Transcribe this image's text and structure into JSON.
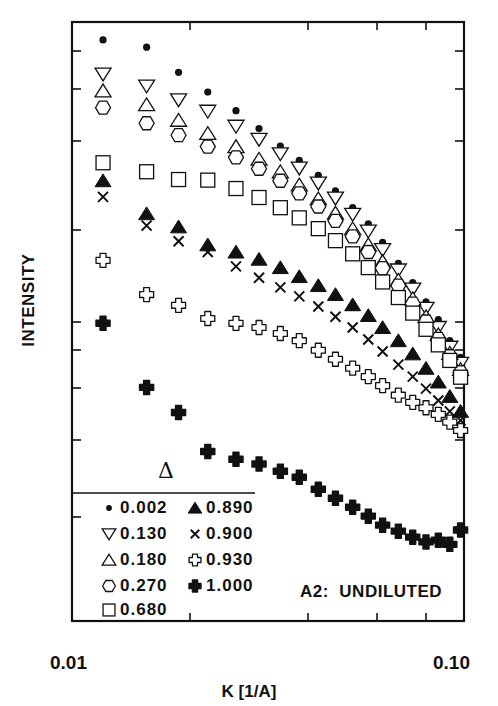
{
  "chart_data": {
    "type": "scatter",
    "title": "",
    "xlabel": "K [1/A]",
    "ylabel": "INTENSITY",
    "xscale": "log",
    "xlim": [
      0.01,
      0.1
    ],
    "x_tick_labels": [
      "0.01",
      "0.10"
    ],
    "x_minor_ticks": [
      0.02,
      0.04,
      0.06,
      0.08
    ],
    "yscale": "log (unlabeled, arbitrary units)",
    "y_note": "y values are relative positions (0 = bottom of frame, 1 = top of frame) read from the plot; axis has no numeric labels",
    "ylim": [
      0,
      1
    ],
    "grid": false,
    "annotation": "A2:  UNDILUTED",
    "legend": {
      "title": "Δ",
      "position": "lower-left",
      "entries": [
        {
          "marker": "filled-circle",
          "label": "0.002"
        },
        {
          "marker": "down-triangle",
          "label": "0.130"
        },
        {
          "marker": "up-triangle",
          "label": "0.180"
        },
        {
          "marker": "hexagon",
          "label": "0.270"
        },
        {
          "marker": "square",
          "label": "0.680"
        },
        {
          "marker": "filled-triangle",
          "label": "0.890"
        },
        {
          "marker": "cross",
          "label": "0.900"
        },
        {
          "marker": "open-cross",
          "label": "0.930"
        },
        {
          "marker": "filled-cross",
          "label": "1.000"
        }
      ]
    },
    "series": [
      {
        "name": "0.002",
        "marker": "filled-circle",
        "x": [
          0.012,
          0.0155,
          0.0187,
          0.0222,
          0.0262,
          0.03,
          0.034,
          0.038,
          0.0425,
          0.047,
          0.052,
          0.057,
          0.062,
          0.068,
          0.074,
          0.08,
          0.086,
          0.092,
          0.098
        ],
        "y": [
          0.97,
          0.958,
          0.916,
          0.883,
          0.852,
          0.822,
          0.793,
          0.769,
          0.744,
          0.718,
          0.69,
          0.663,
          0.632,
          0.597,
          0.565,
          0.533,
          0.503,
          0.468,
          0.44
        ]
      },
      {
        "name": "0.130",
        "marker": "down-triangle",
        "x": [
          0.012,
          0.0155,
          0.0187,
          0.0222,
          0.0262,
          0.03,
          0.034,
          0.038,
          0.0425,
          0.047,
          0.052,
          0.057,
          0.062,
          0.068,
          0.074,
          0.08,
          0.086,
          0.092,
          0.098
        ],
        "y": [
          0.913,
          0.893,
          0.87,
          0.851,
          0.826,
          0.804,
          0.78,
          0.756,
          0.731,
          0.706,
          0.679,
          0.651,
          0.62,
          0.586,
          0.554,
          0.522,
          0.49,
          0.457,
          0.43
        ]
      },
      {
        "name": "0.180",
        "marker": "up-triangle",
        "x": [
          0.012,
          0.0155,
          0.0187,
          0.0222,
          0.0262,
          0.03,
          0.034,
          0.038,
          0.0425,
          0.047,
          0.052,
          0.057,
          0.062,
          0.068,
          0.074,
          0.08,
          0.086,
          0.092,
          0.098
        ],
        "y": [
          0.885,
          0.862,
          0.836,
          0.814,
          0.792,
          0.771,
          0.75,
          0.728,
          0.705,
          0.681,
          0.655,
          0.628,
          0.6,
          0.569,
          0.538,
          0.508,
          0.478,
          0.447,
          0.42
        ]
      },
      {
        "name": "0.270",
        "marker": "hexagon",
        "x": [
          0.012,
          0.0155,
          0.0187,
          0.0222,
          0.0262,
          0.03,
          0.034,
          0.038,
          0.0425,
          0.047,
          0.052,
          0.057,
          0.062,
          0.068,
          0.074,
          0.08,
          0.086,
          0.092,
          0.098
        ],
        "y": [
          0.857,
          0.831,
          0.811,
          0.792,
          0.774,
          0.755,
          0.735,
          0.714,
          0.692,
          0.668,
          0.642,
          0.616,
          0.589,
          0.56,
          0.53,
          0.5,
          0.471,
          0.442,
          0.415
        ]
      },
      {
        "name": "0.680",
        "marker": "square",
        "x": [
          0.012,
          0.0155,
          0.0187,
          0.0222,
          0.0262,
          0.03,
          0.034,
          0.038,
          0.0425,
          0.047,
          0.052,
          0.057,
          0.062,
          0.068,
          0.074,
          0.08,
          0.086,
          0.092,
          0.098
        ],
        "y": [
          0.765,
          0.75,
          0.737,
          0.736,
          0.722,
          0.707,
          0.69,
          0.673,
          0.655,
          0.635,
          0.613,
          0.59,
          0.566,
          0.54,
          0.514,
          0.487,
          0.461,
          0.435,
          0.407
        ]
      },
      {
        "name": "0.890",
        "marker": "filled-triangle",
        "x": [
          0.012,
          0.0155,
          0.0187,
          0.0222,
          0.0262,
          0.03,
          0.034,
          0.038,
          0.0425,
          0.047,
          0.052,
          0.057,
          0.062,
          0.068,
          0.074,
          0.08,
          0.086,
          0.092,
          0.098
        ],
        "y": [
          0.735,
          0.68,
          0.658,
          0.628,
          0.616,
          0.604,
          0.59,
          0.575,
          0.56,
          0.545,
          0.528,
          0.51,
          0.49,
          0.468,
          0.446,
          0.422,
          0.399,
          0.375,
          0.35
        ]
      },
      {
        "name": "0.900",
        "marker": "cross",
        "x": [
          0.012,
          0.0155,
          0.0187,
          0.0222,
          0.0262,
          0.03,
          0.034,
          0.038,
          0.0425,
          0.047,
          0.052,
          0.057,
          0.062,
          0.068,
          0.074,
          0.08,
          0.086,
          0.092,
          0.098
        ],
        "y": [
          0.708,
          0.66,
          0.634,
          0.616,
          0.592,
          0.573,
          0.557,
          0.542,
          0.525,
          0.508,
          0.49,
          0.47,
          0.45,
          0.428,
          0.408,
          0.388,
          0.368,
          0.35,
          0.335
        ]
      },
      {
        "name": "0.930",
        "marker": "open-cross",
        "x": [
          0.012,
          0.0155,
          0.0187,
          0.0222,
          0.0262,
          0.03,
          0.034,
          0.038,
          0.0425,
          0.047,
          0.052,
          0.057,
          0.062,
          0.068,
          0.074,
          0.08,
          0.086,
          0.092,
          0.098
        ],
        "y": [
          0.602,
          0.545,
          0.527,
          0.505,
          0.497,
          0.49,
          0.48,
          0.468,
          0.452,
          0.437,
          0.422,
          0.408,
          0.393,
          0.377,
          0.365,
          0.356,
          0.345,
          0.332,
          0.318
        ]
      },
      {
        "name": "1.000",
        "marker": "filled-cross",
        "x": [
          0.012,
          0.0155,
          0.0187,
          0.0222,
          0.0262,
          0.03,
          0.034,
          0.038,
          0.0425,
          0.047,
          0.052,
          0.057,
          0.062,
          0.068,
          0.074,
          0.08,
          0.086,
          0.092,
          0.098
        ],
        "y": [
          0.497,
          0.39,
          0.348,
          0.283,
          0.27,
          0.262,
          0.25,
          0.24,
          0.22,
          0.205,
          0.19,
          0.175,
          0.16,
          0.15,
          0.14,
          0.132,
          0.135,
          0.128,
          0.152
        ]
      }
    ]
  },
  "layout": {
    "frame": {
      "left": 72,
      "right": 464,
      "top": 22,
      "bottom": 621
    },
    "left_ticks_px": [
      51,
      89,
      141,
      230,
      322,
      350,
      388,
      440,
      517
    ],
    "right_ticks_px": [
      51,
      89,
      141,
      230,
      322,
      350,
      388,
      440,
      527
    ],
    "legend_divider_y": 493,
    "legend_divider_x2": 255
  }
}
